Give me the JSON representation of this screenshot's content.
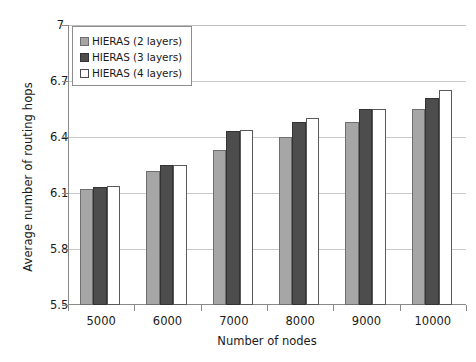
{
  "chart_data": {
    "type": "bar",
    "title": "",
    "xlabel": "Number of  nodes",
    "ylabel": "Average number of routing hops",
    "categories": [
      "5000",
      "6000",
      "7000",
      "8000",
      "9000",
      "10000"
    ],
    "series": [
      {
        "name": "HIERAS (2 layers)",
        "color": "#a6a6a6",
        "values": [
          6.12,
          6.22,
          6.33,
          6.4,
          6.48,
          6.55
        ]
      },
      {
        "name": "HIERAS (3 layers)",
        "color": "#4d4d4d",
        "values": [
          6.13,
          6.25,
          6.43,
          6.48,
          6.55,
          6.61
        ]
      },
      {
        "name": "HIERAS (4 layers)",
        "color": "#ffffff",
        "values": [
          6.14,
          6.25,
          6.44,
          6.5,
          6.55,
          6.65
        ]
      }
    ],
    "ylim": [
      5.5,
      7.0
    ],
    "yticks": [
      "5.5",
      "5.8",
      "6.1",
      "6.4",
      "6.7",
      "7"
    ],
    "ytick_values": [
      5.5,
      5.8,
      6.1,
      6.4,
      6.7,
      7.0
    ],
    "grid": true,
    "legend_position": "top-left"
  }
}
